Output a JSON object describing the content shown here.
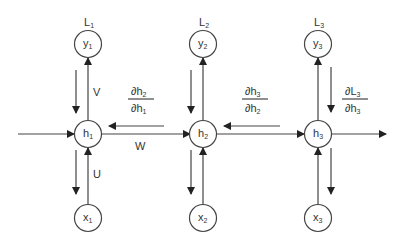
{
  "diagram": {
    "type": "rnn-unrolled-backprop",
    "colors": {
      "stroke": "#333333",
      "node_fill": "#ffffff",
      "text": "#333333"
    },
    "nodes": {
      "outputs": [
        {
          "id": "y1",
          "main": "y",
          "sub": "1",
          "loss_main": "L",
          "loss_sub": "1"
        },
        {
          "id": "y2",
          "main": "y",
          "sub": "2",
          "loss_main": "L",
          "loss_sub": "2"
        },
        {
          "id": "y3",
          "main": "y",
          "sub": "3",
          "loss_main": "L",
          "loss_sub": "3"
        }
      ],
      "hidden": [
        {
          "id": "h1",
          "main": "h",
          "sub": "1"
        },
        {
          "id": "h2",
          "main": "h",
          "sub": "2"
        },
        {
          "id": "h3",
          "main": "h",
          "sub": "3"
        }
      ],
      "inputs": [
        {
          "id": "x1",
          "main": "x",
          "sub": "1"
        },
        {
          "id": "x2",
          "main": "x",
          "sub": "2"
        },
        {
          "id": "x3",
          "main": "x",
          "sub": "3"
        }
      ]
    },
    "weights": {
      "V": "V",
      "W": "W",
      "U": "U"
    },
    "gradients": [
      {
        "id": "dh2_dh1",
        "num_main": "∂h",
        "num_sub": "2",
        "den_main": "∂h",
        "den_sub": "1"
      },
      {
        "id": "dh3_dh2",
        "num_main": "∂h",
        "num_sub": "3",
        "den_main": "∂h",
        "den_sub": "2"
      },
      {
        "id": "dL3_dh3",
        "num_main": "∂L",
        "num_sub": "3",
        "den_main": "∂h",
        "den_sub": "3"
      }
    ]
  }
}
